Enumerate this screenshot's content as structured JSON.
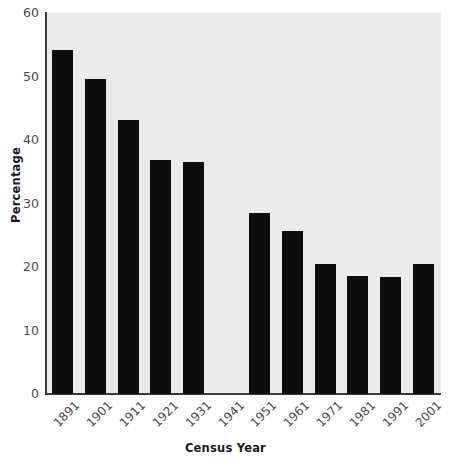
{
  "chart_data": {
    "type": "bar",
    "title": "",
    "xlabel": "Census Year",
    "ylabel": "Percentage",
    "categories": [
      "1891",
      "1901",
      "1911",
      "1921",
      "1931",
      "1941",
      "1951",
      "1961",
      "1971",
      "1981",
      "1991",
      "2001"
    ],
    "values": [
      54.2,
      49.6,
      43.1,
      36.9,
      36.5,
      null,
      28.5,
      25.6,
      20.4,
      18.6,
      18.4,
      20.4
    ],
    "ylim": [
      0,
      60
    ],
    "yticks": [
      0,
      10,
      20,
      30,
      40,
      50,
      60
    ],
    "ytick_labels": [
      "0",
      "10",
      "20",
      "30",
      "40",
      "50",
      "60"
    ],
    "grid": false,
    "legend": null,
    "bar_color": "#0d0d0d",
    "plot_background": "#ebebeb",
    "figure_background": "#ffffff",
    "axis_color": "#3a3a3a"
  }
}
